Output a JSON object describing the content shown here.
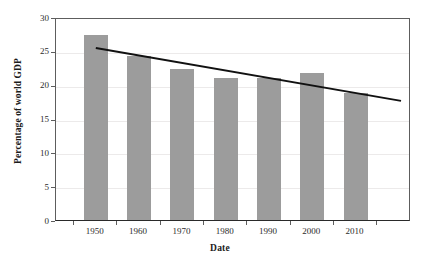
{
  "chart_data": {
    "type": "bar",
    "title": "",
    "xlabel": "Date",
    "ylabel": "Percentage of world GDP",
    "categories": [
      "1950",
      "1960",
      "1970",
      "1980",
      "1990",
      "2000",
      "2010"
    ],
    "values": [
      27.3,
      24.3,
      22.3,
      21.0,
      21.0,
      21.8,
      18.7
    ],
    "series": [
      {
        "name": "Percentage of world GDP",
        "values": [
          27.3,
          24.3,
          22.3,
          21.0,
          21.0,
          21.8,
          18.7
        ]
      }
    ],
    "ylim": [
      0,
      30
    ],
    "ytick_labels": [
      "0",
      "5",
      "10",
      "15",
      "20",
      "25",
      "30"
    ],
    "ytick_values": [
      0,
      5,
      10,
      15,
      20,
      25,
      30
    ],
    "xtick_labels": [
      "1950",
      "1960",
      "1970",
      "1980",
      "1990",
      "2000",
      "2010"
    ],
    "grid": true,
    "grid_axis": "y",
    "legend": false,
    "legend_position": "none",
    "bar_color": "#9c9c9c",
    "annotations": [
      {
        "type": "trendline",
        "label": "linear trend",
        "color": "#111111",
        "x_start": "1950",
        "y_start": 25.7,
        "x_end": "2020",
        "y_end": 17.9
      }
    ]
  },
  "axes": {
    "y_title": "Percentage of world GDP",
    "x_title": "Date",
    "y_ticks": [
      {
        "label": "30",
        "value": 30
      },
      {
        "label": "25",
        "value": 25
      },
      {
        "label": "20",
        "value": 20
      },
      {
        "label": "15",
        "value": 15
      },
      {
        "label": "10",
        "value": 10
      },
      {
        "label": "5",
        "value": 5
      },
      {
        "label": "0",
        "value": 0
      }
    ],
    "x_ticks": [
      {
        "label": "1950"
      },
      {
        "label": "1960"
      },
      {
        "label": "1970"
      },
      {
        "label": "1980"
      },
      {
        "label": "1990"
      },
      {
        "label": "2000"
      },
      {
        "label": "2010"
      }
    ]
  },
  "bars": [
    {
      "category": "1950",
      "value": 27.3
    },
    {
      "category": "1960",
      "value": 24.3
    },
    {
      "category": "1970",
      "value": 22.3
    },
    {
      "category": "1980",
      "value": 21.0
    },
    {
      "category": "1990",
      "value": 21.0
    },
    {
      "category": "2000",
      "value": 21.8
    },
    {
      "category": "2010",
      "value": 18.7
    }
  ]
}
